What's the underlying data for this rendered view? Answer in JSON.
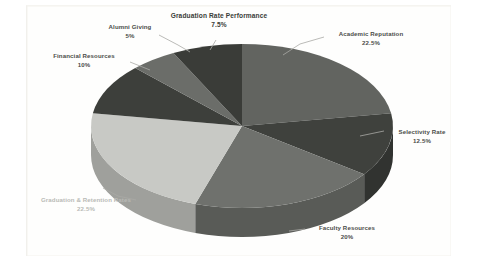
{
  "chart_data": {
    "type": "pie",
    "title": "",
    "xlabel": "",
    "ylabel": "",
    "legend_position": "callout-labels",
    "grid": false,
    "three_d": true,
    "start_angle_deg": 0,
    "direction": "clockwise",
    "unit": "%",
    "categories": [
      "Academic Reputation",
      "Selectivity Rate",
      "Faculty Resources",
      "Graduation & Retention Rates",
      "Financial Resources",
      "Alumni Giving",
      "Graduation Rate Performance"
    ],
    "values": [
      22.5,
      12.5,
      20,
      22.5,
      10,
      5,
      7.5
    ],
    "slices": [
      {
        "label": "Academic Reputation",
        "pct": "22.5%",
        "value": 22.5,
        "color": "#626460",
        "side_color": "#4e504c"
      },
      {
        "label": "Selectivity Rate",
        "pct": "12.5%",
        "value": 12.5,
        "color": "#3f413d",
        "side_color": "#313330"
      },
      {
        "label": "Faculty Resources",
        "pct": "20%",
        "value": 20,
        "color": "#6f716d",
        "side_color": "#595b57"
      },
      {
        "label": "Graduation & Retention Rates",
        "pct": "22.5%",
        "value": 22.5,
        "color": "#c8c9c5",
        "side_color": "#9fa09c"
      },
      {
        "label": "Financial Resources",
        "pct": "10%",
        "value": 10,
        "color": "#3d3f3b",
        "side_color": "#2f312d"
      },
      {
        "label": "Alumni Giving",
        "pct": "5%",
        "value": 5,
        "color": "#6b6d69",
        "side_color": "#55574f"
      },
      {
        "label": "Graduation Rate Performance",
        "pct": "7.5%",
        "value": 7.5,
        "color": "#3a3c38",
        "side_color": "#2c2e2a"
      }
    ]
  },
  "labels": {
    "graduation_rate_performance": {
      "name": "Graduation Rate Performance",
      "pct": "7.5%"
    },
    "alumni_giving": {
      "name": "Alumni Giving",
      "pct": "5%"
    },
    "financial_resources": {
      "name": "Financial Resources",
      "pct": "10%"
    },
    "graduation_retention": {
      "name": "Graduation & Retention Rates",
      "pct": "22.5%"
    },
    "faculty_resources": {
      "name": "Faculty Resources",
      "pct": "20%"
    },
    "selectivity_rate": {
      "name": "Selectivity Rate",
      "pct": "12.5%"
    },
    "academic_reputation": {
      "name": "Academic Reputation",
      "pct": "22.5%"
    }
  },
  "colors": {
    "background": "#ffffff",
    "text": "#4b4d49",
    "text_light": "#b9bab6",
    "leader_line": "#a9aaa6"
  }
}
